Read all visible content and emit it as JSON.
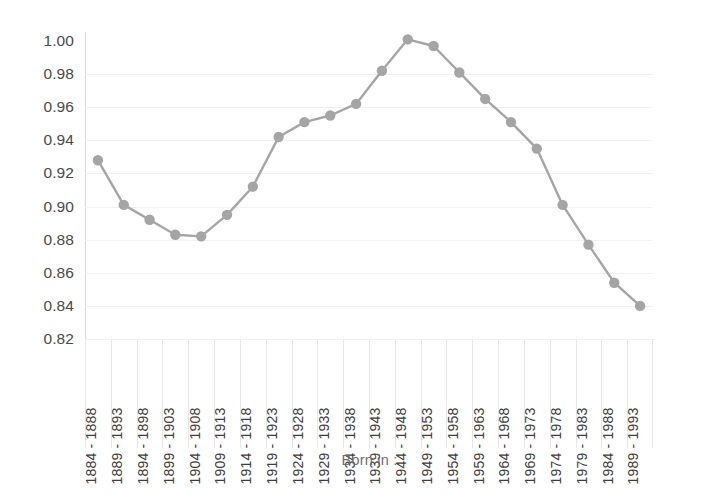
{
  "chart_data": {
    "type": "line",
    "title": "",
    "subtitle": "",
    "xlabel": "Born in :",
    "ylabel": "",
    "categories": [
      "1884 - 1888",
      "1889 - 1893",
      "1894 - 1898",
      "1899 - 1903",
      "1904 - 1908",
      "1909 - 1913",
      "1914 - 1918",
      "1919 - 1923",
      "1924 - 1928",
      "1929 - 1933",
      "1934 - 1938",
      "1939 - 1943",
      "1944 - 1948",
      "1949 - 1953",
      "1954 - 1958",
      "1959 - 1963",
      "1964 - 1968",
      "1969 - 1973",
      "1974 - 1978",
      "1979 - 1983",
      "1984 - 1988",
      "1989 - 1993"
    ],
    "values": [
      0.928,
      0.901,
      0.892,
      0.883,
      0.882,
      0.895,
      0.912,
      0.942,
      0.951,
      0.955,
      0.962,
      0.982,
      1.001,
      0.997,
      0.981,
      0.965,
      0.951,
      0.935,
      0.901,
      0.877,
      0.854,
      0.84
    ],
    "ylim": [
      0.82,
      1.0
    ],
    "ytick_step": 0.02,
    "ytick_labels": [
      "1.00",
      "0.98",
      "0.96",
      "0.94",
      "0.92",
      "0.90",
      "0.88",
      "0.86",
      "0.84",
      "0.82"
    ],
    "grid": true,
    "legend": false,
    "legend_position": "none",
    "series_color": "#a5a5a5",
    "marker_color": "#a5a5a5",
    "gridline_color": "#f1f1f1",
    "axis_color": "#d9d9d9"
  }
}
